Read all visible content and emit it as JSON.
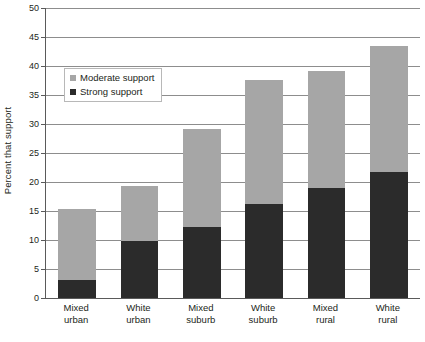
{
  "chart_data": {
    "type": "bar",
    "subtype": "stacked-vertical",
    "title": "",
    "subtitle": "",
    "xlabel": "",
    "ylabel": "Percent that support",
    "ylim": [
      0,
      50
    ],
    "ytick_step": 5,
    "yticks": [
      0,
      5,
      10,
      15,
      20,
      25,
      30,
      35,
      40,
      45,
      50
    ],
    "ytick_labels": [
      "0",
      "5",
      "10",
      "15",
      "20",
      "25",
      "30",
      "35",
      "40",
      "45",
      "50"
    ],
    "grid": "horizontal",
    "legend_position": "upper-left-inside",
    "categories": [
      "Mixed urban",
      "White urban",
      "Mixed suburb",
      "White suburb",
      "Mixed rural",
      "White rural"
    ],
    "category_lines": [
      [
        "Mixed",
        "urban"
      ],
      [
        "White",
        "urban"
      ],
      [
        "Mixed",
        "suburb"
      ],
      [
        "White",
        "suburb"
      ],
      [
        "Mixed",
        "rural"
      ],
      [
        "White",
        "rural"
      ]
    ],
    "series": [
      {
        "name": "Strong support",
        "color": "#2b2b2b",
        "values": [
          3.1,
          9.8,
          12.2,
          16.2,
          19.0,
          21.8
        ]
      },
      {
        "name": "Moderate support",
        "color": "#a6a6a6",
        "values": [
          12.3,
          9.6,
          16.9,
          21.4,
          20.2,
          21.7
        ]
      }
    ],
    "stack_totals": [
      15.4,
      19.4,
      29.1,
      37.6,
      39.2,
      43.5
    ],
    "stack_order_bottom_to_top": [
      "Strong support",
      "Moderate support"
    ]
  },
  "legend": {
    "items": [
      {
        "label": "Moderate support",
        "swatch": "moderate"
      },
      {
        "label": "Strong support",
        "swatch": "strong"
      }
    ]
  },
  "colors": {
    "moderate_support": "#a6a6a6",
    "strong_support": "#2b2b2b",
    "gridline": "#8d8d8d",
    "axis": "#5a5a5a",
    "text": "#231f20",
    "background": "#ffffff"
  }
}
